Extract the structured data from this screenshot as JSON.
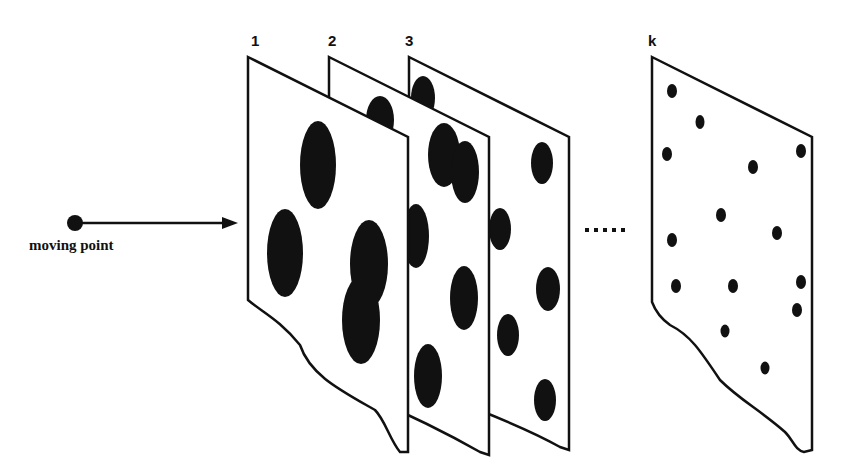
{
  "diagram": {
    "moving_point": {
      "label": "moving point"
    },
    "planes": [
      {
        "label": "1"
      },
      {
        "label": "2"
      },
      {
        "label": "3"
      },
      {
        "label": "k"
      }
    ],
    "ellipsis": "......",
    "colors": {
      "ink": "#111111",
      "paper": "#ffffff"
    }
  }
}
